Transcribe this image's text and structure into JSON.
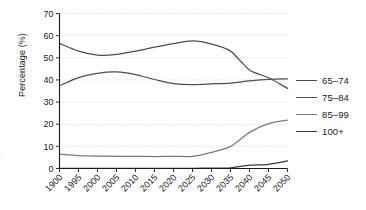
{
  "chart_data": {
    "type": "line",
    "title": "",
    "xlabel": "",
    "ylabel": "Percentage (%)",
    "ylim": [
      0,
      70
    ],
    "ytick_step": 10,
    "yticks": [
      "0",
      "10",
      "20",
      "30",
      "40",
      "50",
      "60",
      "70"
    ],
    "grid": true,
    "grid_style": "dotted-horizontal",
    "legend_position": "right",
    "categories": [
      "1900",
      "1995",
      "2000",
      "2005",
      "2010",
      "2015",
      "2020",
      "2025",
      "2030",
      "2035",
      "2040",
      "2045",
      "2050"
    ],
    "series": [
      {
        "name": "65-74",
        "color": "#4d4d4d",
        "values": [
          56.5,
          53.0,
          51.2,
          51.5,
          53.0,
          54.8,
          56.4,
          57.6,
          56.2,
          53.0,
          44.5,
          41.0,
          36.2
        ]
      },
      {
        "name": "75-84",
        "color": "#4d4d4d",
        "values": [
          37.4,
          41.0,
          43.0,
          43.6,
          42.4,
          40.2,
          38.3,
          37.9,
          38.2,
          38.6,
          39.6,
          40.3,
          40.5
        ]
      },
      {
        "name": "85-99",
        "color": "#7a7a7a",
        "values": [
          6.5,
          5.8,
          5.6,
          5.5,
          5.5,
          5.4,
          5.5,
          5.5,
          7.3,
          10.0,
          16.3,
          20.3,
          21.8
        ]
      },
      {
        "name": "100+",
        "color": "#3a3a3a",
        "values": [
          0.1,
          0.1,
          0.1,
          0.1,
          0.1,
          0.1,
          0.1,
          0.1,
          0.15,
          0.3,
          1.5,
          1.9,
          3.4
        ]
      }
    ]
  },
  "axes": {
    "y_title": "Percentage (%)"
  },
  "legend": {
    "items": [
      {
        "label": "65–74",
        "color": "#4d4d4d"
      },
      {
        "label": "75–84",
        "color": "#4d4d4d"
      },
      {
        "label": "85–99",
        "color": "#7a7a7a"
      },
      {
        "label": "100+",
        "color": "#3a3a3a"
      }
    ]
  },
  "artifacts": {
    "edge_mark": "·"
  }
}
